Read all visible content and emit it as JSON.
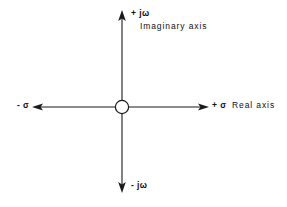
{
  "diagram": {
    "background_color": "#ffffff",
    "line_color": "#1a1a1a",
    "labels": {
      "positive_imaginary": "+ jω",
      "imaginary_axis_name": "Imaginary axis",
      "negative_real": "- σ",
      "positive_real": "+ σ",
      "real_axis_name": "Real axis",
      "negative_imaginary": "- jω"
    },
    "geometry": {
      "origin_x": 122,
      "origin_y": 107,
      "origin_marker_radius": 7,
      "vertical_axis_top_y": 11,
      "vertical_axis_bottom_y": 192,
      "horizontal_axis_left_x": 33,
      "horizontal_axis_right_x": 208
    }
  }
}
